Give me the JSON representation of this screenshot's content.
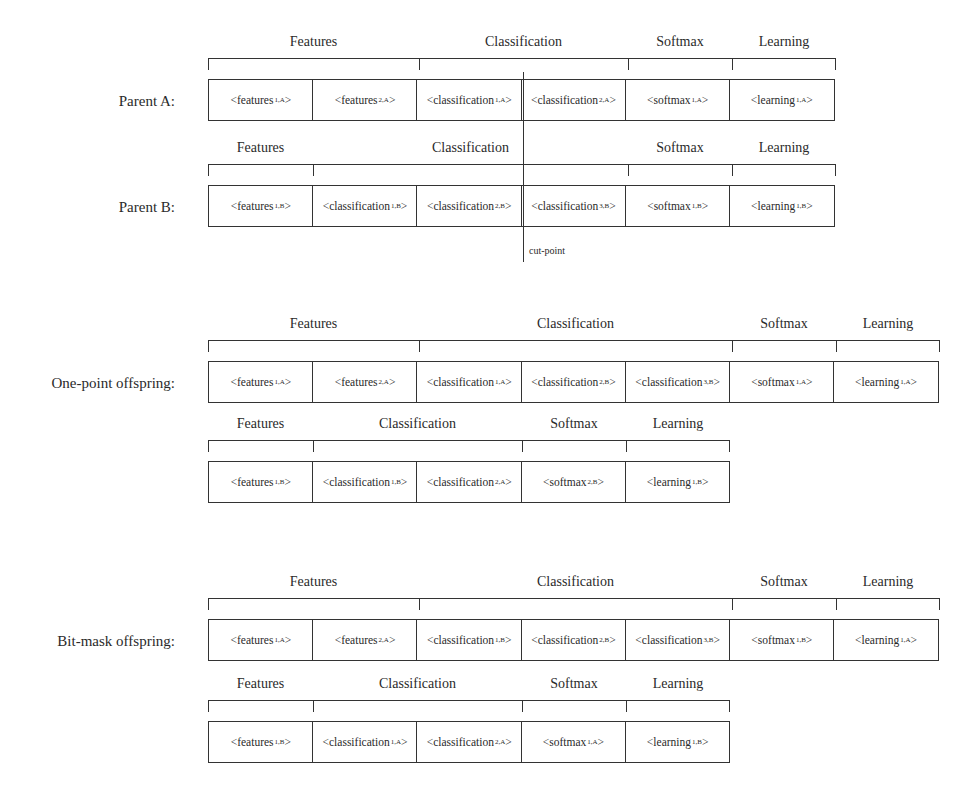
{
  "diagram": {
    "cut_point_label": "cut-point",
    "rows": [
      {
        "id": "parent-a",
        "label": "Parent A:",
        "top": 58,
        "groups": [
          {
            "label": "Features",
            "x": 208,
            "w": 211
          },
          {
            "label": "Classification",
            "x": 419,
            "w": 209
          },
          {
            "label": "Softmax",
            "x": 628,
            "w": 104
          },
          {
            "label": "Learning",
            "x": 732,
            "w": 104
          }
        ],
        "cells": [
          {
            "name": "features",
            "sub": "1,A"
          },
          {
            "name": "features",
            "sub": "2,A"
          },
          {
            "name": "classification",
            "sub": "1,A"
          },
          {
            "name": "classification",
            "sub": "2,A"
          },
          {
            "name": "softmax",
            "sub": "1,A"
          },
          {
            "name": "learning",
            "sub": "1,A"
          }
        ]
      },
      {
        "id": "parent-b",
        "label": "Parent B:",
        "top": 164,
        "groups": [
          {
            "label": "Features",
            "x": 208,
            "w": 105
          },
          {
            "label": "Classification",
            "x": 313,
            "w": 315
          },
          {
            "label": "Softmax",
            "x": 628,
            "w": 104
          },
          {
            "label": "Learning",
            "x": 732,
            "w": 104
          }
        ],
        "cells": [
          {
            "name": "features",
            "sub": "1,B"
          },
          {
            "name": "classification",
            "sub": "1,B"
          },
          {
            "name": "classification",
            "sub": "2,B"
          },
          {
            "name": "classification",
            "sub": "3,B"
          },
          {
            "name": "softmax",
            "sub": "1,B"
          },
          {
            "name": "learning",
            "sub": "1,B"
          }
        ]
      },
      {
        "id": "one-point-offspring-1",
        "label": "One-point offspring:",
        "top": 340,
        "groups": [
          {
            "label": "Features",
            "x": 208,
            "w": 211
          },
          {
            "label": "Classification",
            "x": 419,
            "w": 313
          },
          {
            "label": "Softmax",
            "x": 732,
            "w": 104
          },
          {
            "label": "Learning",
            "x": 836,
            "w": 104
          }
        ],
        "cells": [
          {
            "name": "features",
            "sub": "1,A"
          },
          {
            "name": "features",
            "sub": "2,A"
          },
          {
            "name": "classification",
            "sub": "1,A"
          },
          {
            "name": "classification",
            "sub": "2,B"
          },
          {
            "name": "classification",
            "sub": "3,B"
          },
          {
            "name": "softmax",
            "sub": "1,A"
          },
          {
            "name": "learning",
            "sub": "1,A"
          }
        ]
      },
      {
        "id": "one-point-offspring-2",
        "label": "",
        "top": 440,
        "groups": [
          {
            "label": "Features",
            "x": 208,
            "w": 105
          },
          {
            "label": "Classification",
            "x": 313,
            "w": 209
          },
          {
            "label": "Softmax",
            "x": 522,
            "w": 104
          },
          {
            "label": "Learning",
            "x": 626,
            "w": 104
          }
        ],
        "cells": [
          {
            "name": "features",
            "sub": "1,B"
          },
          {
            "name": "classification",
            "sub": "1,B"
          },
          {
            "name": "classification",
            "sub": "2,A"
          },
          {
            "name": "softmax",
            "sub": "2,B"
          },
          {
            "name": "learning",
            "sub": "1,B"
          }
        ]
      },
      {
        "id": "bit-mask-offspring-1",
        "label": "Bit-mask offspring:",
        "top": 598,
        "groups": [
          {
            "label": "Features",
            "x": 208,
            "w": 211
          },
          {
            "label": "Classification",
            "x": 419,
            "w": 313
          },
          {
            "label": "Softmax",
            "x": 732,
            "w": 104
          },
          {
            "label": "Learning",
            "x": 836,
            "w": 104
          }
        ],
        "cells": [
          {
            "name": "features",
            "sub": "1,A"
          },
          {
            "name": "features",
            "sub": "2,A"
          },
          {
            "name": "classification",
            "sub": "1,B"
          },
          {
            "name": "classification",
            "sub": "2,B"
          },
          {
            "name": "classification",
            "sub": "3,B"
          },
          {
            "name": "softmax",
            "sub": "1,B"
          },
          {
            "name": "learning",
            "sub": "1,A"
          }
        ]
      },
      {
        "id": "bit-mask-offspring-2",
        "label": "",
        "top": 700,
        "groups": [
          {
            "label": "Features",
            "x": 208,
            "w": 105
          },
          {
            "label": "Classification",
            "x": 313,
            "w": 209
          },
          {
            "label": "Softmax",
            "x": 522,
            "w": 104
          },
          {
            "label": "Learning",
            "x": 626,
            "w": 104
          }
        ],
        "cells": [
          {
            "name": "features",
            "sub": "1,B"
          },
          {
            "name": "classification",
            "sub": "1,A"
          },
          {
            "name": "classification",
            "sub": "2,A"
          },
          {
            "name": "softmax",
            "sub": "1,A"
          },
          {
            "name": "learning",
            "sub": "1,B"
          }
        ]
      }
    ]
  }
}
